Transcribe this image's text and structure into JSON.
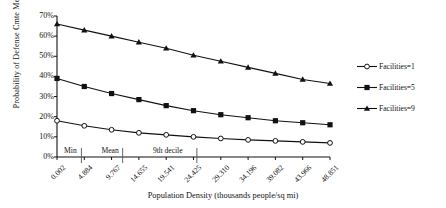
{
  "chart_data": {
    "type": "line",
    "title": "",
    "xlabel": "Population Density (thousands people/sq mi)",
    "ylabel": "Probability of Defense Cmte Membership",
    "x": [
      0.002,
      4.884,
      9.767,
      14.655,
      19.541,
      24.425,
      29.31,
      34.196,
      39.082,
      43.966,
      48.851
    ],
    "xtick_labels": [
      "0.002",
      "4.884",
      "9.767",
      "14.655",
      "19.541",
      "24.425",
      "29.310",
      "34.196",
      "39.082",
      "43.966",
      "48.851"
    ],
    "ytick_labels": [
      "0%",
      "10%",
      "20%",
      "30%",
      "40%",
      "50%",
      "60%",
      "70%"
    ],
    "yticks": [
      0,
      10,
      20,
      30,
      40,
      50,
      60,
      70
    ],
    "ylim": [
      0,
      70
    ],
    "grid": false,
    "legend_position": "right",
    "series": [
      {
        "name": "Facilities=1",
        "marker": "open-circle",
        "values": [
          18.0,
          15.5,
          13.5,
          12.0,
          11.0,
          10.0,
          9.2,
          8.5,
          8.0,
          7.5,
          7.0
        ]
      },
      {
        "name": "Facilities=5",
        "marker": "filled-square",
        "values": [
          39.0,
          35.0,
          31.5,
          28.5,
          25.5,
          23.0,
          21.0,
          19.5,
          18.0,
          17.0,
          16.0
        ]
      },
      {
        "name": "Facilities=9",
        "marker": "filled-triangle",
        "values": [
          66.0,
          63.0,
          60.0,
          57.0,
          54.0,
          50.5,
          47.5,
          44.5,
          41.5,
          38.5,
          36.5
        ]
      }
    ],
    "annotations": [
      {
        "label": "Min",
        "x": 0.9
      },
      {
        "label": "Mean",
        "x": 7.6
      },
      {
        "label": "9th decile",
        "x": 16.8
      }
    ]
  },
  "legend": {
    "items": [
      {
        "label": "Facilities=1"
      },
      {
        "label": "Facilities=5"
      },
      {
        "label": "Facilities=9"
      }
    ]
  }
}
